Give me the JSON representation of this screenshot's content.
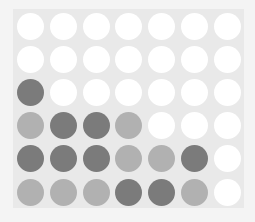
{
  "game": {
    "name": "Connect Four",
    "rows": 6,
    "columns": 7,
    "colors": {
      "board": "#e9e9e9",
      "empty": "#ffffff",
      "dark": "#7b7b7b",
      "light": "#b1b1b1"
    },
    "grid": [
      [
        "empty",
        "empty",
        "empty",
        "empty",
        "empty",
        "empty",
        "empty"
      ],
      [
        "empty",
        "empty",
        "empty",
        "empty",
        "empty",
        "empty",
        "empty"
      ],
      [
        "dark",
        "empty",
        "empty",
        "empty",
        "empty",
        "empty",
        "empty"
      ],
      [
        "light",
        "dark",
        "dark",
        "light",
        "empty",
        "empty",
        "empty"
      ],
      [
        "dark",
        "dark",
        "dark",
        "light",
        "light",
        "dark",
        "empty"
      ],
      [
        "light",
        "light",
        "light",
        "dark",
        "dark",
        "light",
        "empty"
      ]
    ]
  }
}
